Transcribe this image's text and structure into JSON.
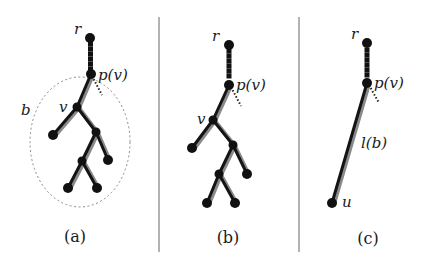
{
  "figure": {
    "colors": {
      "edge": "#141414",
      "shadow": "#8a8a8a",
      "node": "#111111",
      "divider": "#555555",
      "ellipse": "#8a8a8a"
    },
    "panels": [
      {
        "id": "a",
        "caption": "(a)",
        "labels": {
          "root": "r",
          "parent": "p(v)",
          "child": "v",
          "subtree": "b"
        },
        "description": "Tree rooted at r; dashed path r to p(v); subtree b rooted at v enclosed in dashed ellipse"
      },
      {
        "id": "b",
        "caption": "(b)",
        "labels": {
          "root": "r",
          "parent": "p(v)",
          "child": "v"
        },
        "description": "Same tree without the enclosing ellipse"
      },
      {
        "id": "c",
        "caption": "(c)",
        "labels": {
          "root": "r",
          "parent": "p(v)",
          "edge": "l(b)",
          "leaf": "u"
        },
        "description": "Subtree b replaced by a single edge of length l(b) from p(v) to leaf u"
      }
    ]
  }
}
